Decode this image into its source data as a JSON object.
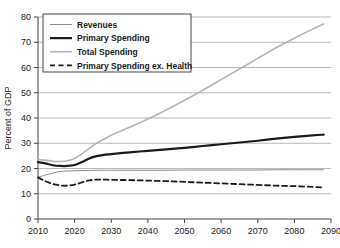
{
  "chart_data": {
    "type": "line",
    "title": "",
    "xlabel": "",
    "ylabel": "Percent of GDP",
    "xlim": [
      2010,
      2090
    ],
    "ylim": [
      0,
      80
    ],
    "grid": true,
    "legend_position": "top-left",
    "x_ticks": [
      "2010",
      "2020",
      "2030",
      "2040",
      "2050",
      "2060",
      "2070",
      "2080",
      "2090"
    ],
    "y_ticks": [
      "0",
      "10",
      "20",
      "30",
      "40",
      "50",
      "60",
      "70",
      "80"
    ],
    "x": [
      2010,
      2012,
      2014,
      2016,
      2018,
      2020,
      2022,
      2024,
      2026,
      2028,
      2030,
      2035,
      2040,
      2045,
      2050,
      2055,
      2060,
      2065,
      2070,
      2075,
      2080,
      2085,
      2088
    ],
    "series": [
      {
        "name": "Revenues",
        "style": "thin-gray",
        "color": "#8c8c8c",
        "values": [
          16.5,
          17.4,
          18.2,
          18.8,
          19.0,
          19.1,
          19.2,
          19.2,
          19.3,
          19.3,
          19.3,
          19.3,
          19.3,
          19.3,
          19.4,
          19.4,
          19.4,
          19.4,
          19.4,
          19.5,
          19.5,
          19.5,
          19.5
        ]
      },
      {
        "name": "Primary Spending",
        "style": "thick-black",
        "color": "#1a1a1a",
        "values": [
          22.5,
          22.0,
          21.3,
          21.0,
          21.0,
          21.4,
          22.6,
          24.0,
          24.9,
          25.4,
          25.7,
          26.4,
          27.0,
          27.6,
          28.2,
          28.9,
          29.6,
          30.3,
          31.0,
          31.8,
          32.5,
          33.1,
          33.4
        ]
      },
      {
        "name": "Total Spending",
        "style": "light-gray",
        "color": "#b4b4b4",
        "values": [
          23.5,
          23.3,
          22.9,
          22.8,
          23.1,
          24.0,
          25.8,
          28.0,
          30.0,
          31.6,
          33.2,
          36.3,
          39.6,
          43.2,
          47.0,
          51.0,
          55.2,
          59.4,
          63.6,
          67.8,
          71.6,
          75.2,
          77.2
        ]
      },
      {
        "name": "Primary Spending ex. Health",
        "style": "dashed-black",
        "color": "#1a1a1a",
        "values": [
          16.5,
          15.0,
          13.9,
          13.3,
          13.2,
          13.6,
          14.5,
          15.3,
          15.6,
          15.6,
          15.5,
          15.4,
          15.2,
          15.0,
          14.7,
          14.4,
          14.1,
          13.8,
          13.5,
          13.2,
          13.0,
          12.7,
          12.5
        ]
      }
    ]
  },
  "axis": {
    "y_title": "Percent of GDP"
  },
  "legend": {
    "items": [
      {
        "label": "Revenues"
      },
      {
        "label": "Primary Spending"
      },
      {
        "label": "Total Spending"
      },
      {
        "label": "Primary Spending ex. Health"
      }
    ]
  }
}
